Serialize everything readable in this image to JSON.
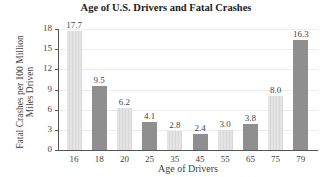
{
  "chart_data": {
    "type": "bar",
    "title": "Age of U.S. Drivers and Fatal Crashes",
    "xlabel": "Age of Drivers",
    "ylabel": "Fatal Crashes per 100 Million Miles Driven",
    "ylabel_lines": [
      "Fatal Crashes per 100 Million",
      "Miles Driven"
    ],
    "categories": [
      "16",
      "18",
      "20",
      "25",
      "35",
      "45",
      "55",
      "65",
      "75",
      "79"
    ],
    "values": [
      17.7,
      9.5,
      6.2,
      4.1,
      2.8,
      2.4,
      3.0,
      3.8,
      8.0,
      16.3
    ],
    "value_labels": [
      "17.7",
      "9.5",
      "6.2",
      "4.1",
      "2.8",
      "2.4",
      "3.0",
      "3.8",
      "8.0",
      "16.3"
    ],
    "bar_shades": [
      "light",
      "dark",
      "light",
      "dark",
      "light",
      "dark",
      "light",
      "dark",
      "light",
      "dark"
    ],
    "yticks": [
      0,
      3,
      6,
      9,
      12,
      15,
      18
    ],
    "ylim": [
      0,
      18
    ],
    "grid": true,
    "legend": null,
    "colors": {
      "light": "#e0e0e0",
      "dark": "#8f8f8f"
    }
  }
}
